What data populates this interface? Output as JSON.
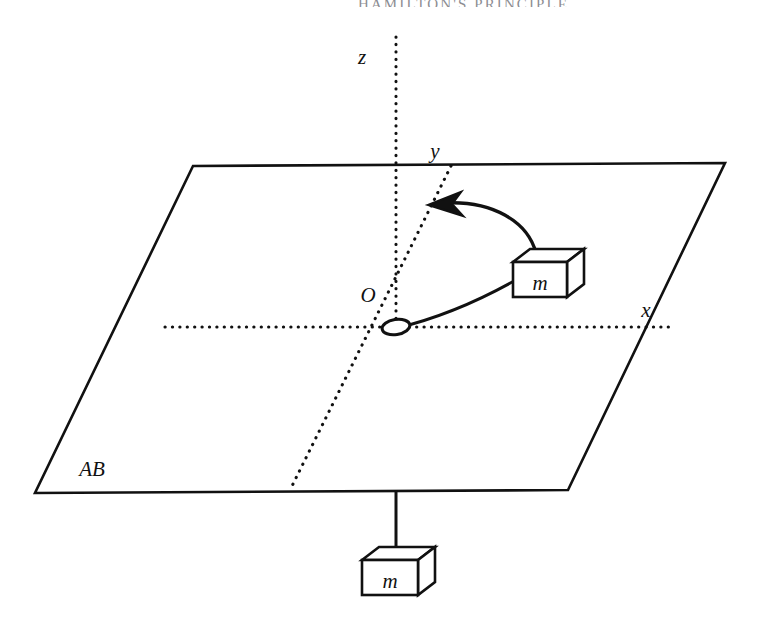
{
  "page": {
    "running_head": "HAMILTON'S PRINCIPLE",
    "background_color": "#ffffff",
    "ink_color": "#111111",
    "width": 777,
    "height": 624
  },
  "figure": {
    "name": "mass-on-frictionless-table-with-hanging-mass",
    "plane": {
      "label": "AB",
      "description": "horizontal frictionless plane drawn in perspective as a parallelogram"
    },
    "axes": [
      {
        "key": "z",
        "label": "z",
        "style": "dotted",
        "orientation": "vertical"
      },
      {
        "key": "y",
        "label": "y",
        "style": "dotted",
        "orientation": "oblique"
      },
      {
        "key": "x",
        "label": "x",
        "style": "dotted",
        "orientation": "horizontal"
      }
    ],
    "origin": {
      "label": "O",
      "marker": "hole-ellipse"
    },
    "bodies": [
      {
        "key": "block-on-plane",
        "label": "m",
        "position": "on the plane, right of origin"
      },
      {
        "key": "hanging-block",
        "label": "m",
        "position": "suspended below the plane on the string"
      }
    ],
    "string": {
      "name": "connecting-string",
      "segments": [
        "origin-to-block-on-plane",
        "origin-to-hanging-block"
      ]
    },
    "motion_arrow": {
      "name": "motion-direction-arrow",
      "direction": "counterclockwise / leftward",
      "head": "left"
    }
  }
}
